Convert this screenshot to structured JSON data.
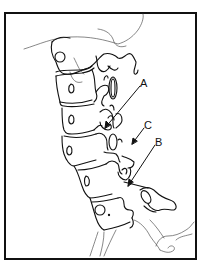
{
  "figure": {
    "labels": {
      "a": "A",
      "b": "B",
      "c": "C"
    },
    "colors": {
      "line": "#111111",
      "thin_line": "#444444",
      "background": "#ffffff",
      "frame": "#111111"
    }
  }
}
